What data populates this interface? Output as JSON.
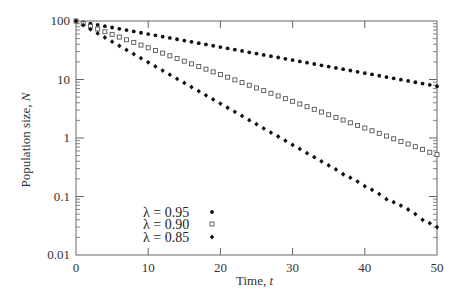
{
  "chart_data": {
    "type": "scatter",
    "title": "",
    "xlabel": "Time, t",
    "ylabel": "Population size, N",
    "xlim": [
      0,
      50
    ],
    "ylim": [
      0.01,
      100
    ],
    "yscale": "log",
    "grid": false,
    "legend_position": "lower-left-inside",
    "x_ticks": [
      0,
      10,
      20,
      30,
      40,
      50
    ],
    "x_tick_labels": [
      "0",
      "10",
      "20",
      "30",
      "40",
      "50"
    ],
    "y_ticks": [
      100,
      10,
      1,
      0.1,
      0.01
    ],
    "y_tick_labels": [
      "100",
      "10",
      "1",
      "0.1",
      "0.01"
    ],
    "x": [
      0,
      1,
      2,
      3,
      4,
      5,
      6,
      7,
      8,
      9,
      10,
      11,
      12,
      13,
      14,
      15,
      16,
      17,
      18,
      19,
      20,
      21,
      22,
      23,
      24,
      25,
      26,
      27,
      28,
      29,
      30,
      31,
      32,
      33,
      34,
      35,
      36,
      37,
      38,
      39,
      40,
      41,
      42,
      43,
      44,
      45,
      46,
      47,
      48,
      49,
      50
    ],
    "series": [
      {
        "name": "λ = 0.95",
        "lambda": 0.95,
        "marker": "filled-circle",
        "values": [
          100,
          95,
          90.25,
          85.74,
          81.45,
          77.38,
          73.51,
          69.83,
          66.34,
          63.02,
          59.87,
          56.88,
          54.04,
          51.33,
          48.77,
          46.33,
          44.01,
          41.81,
          39.72,
          37.74,
          35.85,
          34.06,
          32.35,
          30.74,
          29.2,
          27.74,
          26.35,
          25.03,
          23.78,
          22.59,
          21.46,
          20.39,
          19.37,
          18.4,
          17.48,
          16.61,
          15.78,
          14.99,
          14.24,
          13.53,
          12.85,
          12.21,
          11.6,
          11.02,
          10.47,
          9.94,
          9.45,
          8.97,
          8.53,
          8.1,
          7.69
        ]
      },
      {
        "name": "λ = 0.90",
        "lambda": 0.9,
        "marker": "open-square",
        "values": [
          100,
          90,
          81,
          72.9,
          65.61,
          59.05,
          53.14,
          47.83,
          43.05,
          38.74,
          34.87,
          31.38,
          28.24,
          25.42,
          22.88,
          20.59,
          18.53,
          16.68,
          15.01,
          13.51,
          12.16,
          10.94,
          9.85,
          8.86,
          7.98,
          7.18,
          6.46,
          5.81,
          5.23,
          4.71,
          4.24,
          3.82,
          3.43,
          3.09,
          2.78,
          2.5,
          2.25,
          2.03,
          1.82,
          1.64,
          1.48,
          1.33,
          1.2,
          1.08,
          0.97,
          0.87,
          0.79,
          0.71,
          0.64,
          0.57,
          0.52
        ]
      },
      {
        "name": "λ = 0.85",
        "lambda": 0.85,
        "marker": "filled-diamond",
        "values": [
          100,
          85,
          72.25,
          61.41,
          52.2,
          44.37,
          37.71,
          32.06,
          27.25,
          23.16,
          19.69,
          16.73,
          14.22,
          12.09,
          10.28,
          8.74,
          7.43,
          6.31,
          5.36,
          4.56,
          3.88,
          3.29,
          2.8,
          2.38,
          2.02,
          1.72,
          1.46,
          1.24,
          1.06,
          0.9,
          0.76,
          0.65,
          0.55,
          0.47,
          0.4,
          0.34,
          0.29,
          0.24,
          0.21,
          0.18,
          0.15,
          0.13,
          0.11,
          0.09,
          0.08,
          0.07,
          0.06,
          0.05,
          0.04,
          0.035,
          0.03
        ]
      }
    ]
  },
  "legend": {
    "items": [
      {
        "label": "λ = 0.95",
        "marker": "filled-circle"
      },
      {
        "label": "λ = 0.90",
        "marker": "open-square"
      },
      {
        "label": "λ = 0.85",
        "marker": "filled-diamond"
      }
    ]
  },
  "axes": {
    "xlabel_main": "Time, ",
    "xlabel_var": "t",
    "ylabel_main": "Population size, ",
    "ylabel_var": "N"
  },
  "colors": {
    "axis": "#666666",
    "marker": "#111111",
    "open_marker": "#555555",
    "text": "#333333"
  }
}
